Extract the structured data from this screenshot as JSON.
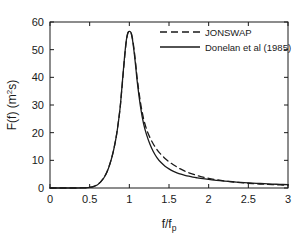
{
  "chart_data": {
    "type": "line",
    "title": "",
    "subtitle": "",
    "xlabel": "f/fp",
    "xlabel_base": "f/f",
    "xlabel_sub": "p",
    "ylabel": "F(f) (m2s)",
    "ylabel_base": "F(f) (m",
    "ylabel_sup": "2",
    "ylabel_tail": "s)",
    "xlim": [
      0,
      3
    ],
    "ylim": [
      0,
      60
    ],
    "xticks": [
      0,
      0.5,
      1,
      1.5,
      2,
      2.5,
      3
    ],
    "xtick_labels": [
      "0",
      "0.5",
      "1",
      "1.5",
      "2",
      "2.5",
      "3"
    ],
    "yticks": [
      0,
      10,
      20,
      30,
      40,
      50,
      60
    ],
    "ytick_labels": [
      "0",
      "10",
      "20",
      "30",
      "40",
      "50",
      "60"
    ],
    "grid": false,
    "legend_position": "top-right",
    "box": true,
    "line_color": "#1a1a1a",
    "series": [
      {
        "name": "JONSWAP",
        "style": "dashed",
        "x": [
          0.0,
          0.1,
          0.2,
          0.3,
          0.4,
          0.45,
          0.5,
          0.55,
          0.6,
          0.64,
          0.68,
          0.72,
          0.76,
          0.8,
          0.84,
          0.88,
          0.9,
          0.92,
          0.94,
          0.96,
          0.98,
          1.0,
          1.02,
          1.04,
          1.06,
          1.08,
          1.1,
          1.14,
          1.18,
          1.22,
          1.26,
          1.3,
          1.35,
          1.4,
          1.45,
          1.5,
          1.55,
          1.6,
          1.65,
          1.7,
          1.75,
          1.8,
          1.85,
          1.9,
          2.0,
          2.1,
          2.2,
          2.3,
          2.4,
          2.5,
          2.6,
          2.7,
          2.8,
          2.9,
          3.0
        ],
        "y": [
          0.0,
          0.0,
          0.0,
          0.0,
          0.02,
          0.08,
          0.25,
          0.6,
          1.3,
          2.3,
          3.8,
          6.0,
          9.2,
          13.5,
          19.5,
          28.0,
          34.0,
          40.5,
          47.0,
          52.5,
          55.8,
          56.5,
          56.3,
          54.0,
          50.0,
          45.0,
          39.5,
          31.0,
          25.0,
          21.0,
          18.2,
          16.0,
          13.8,
          12.1,
          10.7,
          9.5,
          8.5,
          7.6,
          6.8,
          6.1,
          5.5,
          5.0,
          4.55,
          4.15,
          3.5,
          2.98,
          2.55,
          2.22,
          1.95,
          1.72,
          1.52,
          1.36,
          1.22,
          1.1,
          1.0
        ]
      },
      {
        "name": "Donelan et al (1985)",
        "style": "solid",
        "x": [
          0.0,
          0.1,
          0.2,
          0.3,
          0.4,
          0.45,
          0.5,
          0.55,
          0.6,
          0.64,
          0.68,
          0.72,
          0.76,
          0.8,
          0.84,
          0.88,
          0.9,
          0.92,
          0.94,
          0.96,
          0.98,
          1.0,
          1.02,
          1.04,
          1.06,
          1.08,
          1.1,
          1.14,
          1.18,
          1.22,
          1.26,
          1.3,
          1.35,
          1.4,
          1.45,
          1.5,
          1.55,
          1.6,
          1.65,
          1.7,
          1.75,
          1.8,
          1.85,
          1.9,
          2.0,
          2.1,
          2.2,
          2.3,
          2.4,
          2.5,
          2.6,
          2.7,
          2.8,
          2.9,
          3.0
        ],
        "y": [
          0.0,
          0.0,
          0.0,
          0.0,
          0.01,
          0.06,
          0.2,
          0.52,
          1.2,
          2.2,
          3.7,
          5.9,
          9.1,
          13.4,
          19.4,
          28.0,
          34.2,
          41.0,
          47.5,
          53.0,
          56.0,
          56.6,
          56.2,
          53.5,
          49.2,
          44.0,
          38.3,
          29.5,
          23.2,
          19.0,
          15.8,
          13.3,
          10.9,
          9.2,
          7.9,
          6.9,
          6.1,
          5.5,
          5.0,
          4.6,
          4.25,
          3.95,
          3.7,
          3.48,
          3.1,
          2.78,
          2.5,
          2.26,
          2.05,
          1.86,
          1.7,
          1.55,
          1.42,
          1.3,
          1.2
        ]
      }
    ],
    "legend": [
      {
        "label": "JONSWAP",
        "style": "dashed"
      },
      {
        "label": "Donelan et al (1985)",
        "style": "solid"
      }
    ]
  }
}
